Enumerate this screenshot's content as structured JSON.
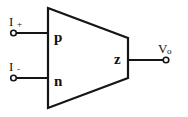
{
  "diagram": {
    "type": "current-conveyor-block-symbol",
    "background_color": "#ffffff",
    "line_color": "#151515",
    "body": {
      "shape": "trapezoid",
      "left_edge": {
        "x": 48,
        "y_top": 8,
        "y_bottom": 108
      },
      "right_edge": {
        "x": 128,
        "y_top": 38,
        "y_bottom": 78
      }
    },
    "port_labels": {
      "p": "p",
      "n": "n",
      "z": "z"
    },
    "terminals": [
      {
        "name": "input-plus",
        "label_main": "I",
        "label_sub": "+",
        "node": {
          "x": 13,
          "y": 33
        },
        "wire_to": {
          "x": 48,
          "y": 33
        }
      },
      {
        "name": "input-minus",
        "label_main": "I",
        "label_sub": "-",
        "node": {
          "x": 13,
          "y": 78
        },
        "wire_to": {
          "x": 48,
          "y": 78
        }
      },
      {
        "name": "output-voltage",
        "label_main": "V",
        "label_sub": "o",
        "node": {
          "x": 166,
          "y": 60
        },
        "wire_to": {
          "x": 128,
          "y": 60
        }
      }
    ]
  }
}
